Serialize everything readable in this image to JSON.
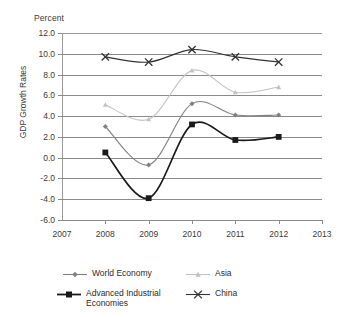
{
  "chart_data": {
    "type": "line",
    "title": "",
    "unit_label": "Percent",
    "xlabel": "",
    "ylabel": "GDP Growth Rates",
    "x": [
      2007,
      2008,
      2009,
      2010,
      2011,
      2012,
      2013
    ],
    "xtick_labels": [
      "2007",
      "2008",
      "2009",
      "2010",
      "2011",
      "2012",
      "2013"
    ],
    "xlim": [
      2007,
      2013
    ],
    "ylim": [
      -6.0,
      12.0
    ],
    "ytick_labels": [
      "12.0",
      "10.0",
      "8.0",
      "6.0",
      "4.0",
      "2.0",
      "0.0",
      "-2.0",
      "-4.0",
      "-6.0"
    ],
    "yticks": [
      12.0,
      10.0,
      8.0,
      6.0,
      4.0,
      2.0,
      0.0,
      -2.0,
      -4.0,
      -6.0
    ],
    "grid": true,
    "legend_position": "bottom",
    "categories": [
      "2008",
      "2009",
      "2010",
      "2011",
      "2012"
    ],
    "series": [
      {
        "name": "World Economy",
        "marker": "diamond",
        "color": "#808080",
        "x": [
          2008,
          2009,
          2010,
          2011,
          2012
        ],
        "values": [
          3.0,
          -0.7,
          5.2,
          4.1,
          4.1
        ]
      },
      {
        "name": "Asia",
        "marker": "triangle",
        "color": "#c2c2c2",
        "x": [
          2008,
          2009,
          2010,
          2011,
          2012
        ],
        "values": [
          5.1,
          3.7,
          8.4,
          6.3,
          6.8
        ]
      },
      {
        "name": "Advanced Industrial\nEconomies",
        "marker": "square",
        "color": "#1a1a1a",
        "x": [
          2008,
          2009,
          2010,
          2011,
          2012
        ],
        "values": [
          0.5,
          -3.9,
          3.2,
          1.7,
          2.0
        ]
      },
      {
        "name": "China",
        "marker": "x",
        "color": "#333333",
        "x": [
          2008,
          2009,
          2010,
          2011,
          2012
        ],
        "values": [
          9.7,
          9.2,
          10.4,
          9.7,
          9.2
        ]
      }
    ]
  },
  "legend": {
    "items": [
      {
        "label": "World Economy"
      },
      {
        "label": "Asia"
      },
      {
        "label": "Advanced Industrial\nEconomies"
      },
      {
        "label": "China"
      }
    ]
  }
}
